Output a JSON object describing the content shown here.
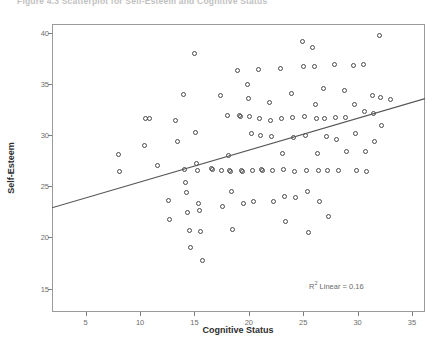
{
  "figure": {
    "caption": "Figure 4.3   Scatterplot for Self-Esteem and Cognitive Status"
  },
  "annotation": {
    "r2_prefix": "R",
    "r2_sup": "2",
    "r2_text": " Linear = 0.16"
  },
  "chart_data": {
    "type": "scatter",
    "title": "Figure 4.3   Scatterplot for Self-Esteem and Cognitive Status",
    "xlabel": "Cognitive Status",
    "ylabel": "Self-Esteem",
    "xlim": [
      1.9,
      36.2
    ],
    "ylim": [
      12.7,
      40.9
    ],
    "xticks": [
      5,
      10,
      15,
      20,
      25,
      30,
      35
    ],
    "yticks": [
      15,
      20,
      25,
      30,
      35,
      40
    ],
    "grid": false,
    "legend": null,
    "marker": "open-circle",
    "marker_color": "#4a4a4a",
    "annotations": [
      {
        "text": "R² Linear = 0.16",
        "x": 26.5,
        "y": 14.8
      }
    ],
    "fit_line": {
      "type": "linear",
      "r_squared": 0.16,
      "x_start": 1.9,
      "y_start": 22.9,
      "x_end": 36.2,
      "y_end": 33.6
    },
    "points": [
      [
        8.0,
        28.1
      ],
      [
        8.1,
        26.5
      ],
      [
        10.4,
        29.0
      ],
      [
        10.5,
        31.6
      ],
      [
        10.9,
        31.6
      ],
      [
        11.6,
        27.0
      ],
      [
        12.6,
        23.6
      ],
      [
        12.7,
        21.8
      ],
      [
        13.3,
        31.5
      ],
      [
        13.4,
        29.4
      ],
      [
        14.0,
        34.0
      ],
      [
        14.1,
        26.7
      ],
      [
        14.2,
        25.4
      ],
      [
        14.3,
        24.4
      ],
      [
        14.4,
        22.4
      ],
      [
        14.5,
        20.7
      ],
      [
        14.6,
        19.0
      ],
      [
        15.0,
        38.0
      ],
      [
        15.1,
        30.3
      ],
      [
        15.2,
        27.2
      ],
      [
        15.3,
        26.6
      ],
      [
        15.4,
        23.3
      ],
      [
        15.5,
        22.6
      ],
      [
        15.6,
        20.6
      ],
      [
        15.7,
        17.7
      ],
      [
        16.6,
        26.8
      ],
      [
        16.7,
        26.7
      ],
      [
        17.4,
        33.9
      ],
      [
        17.5,
        26.6
      ],
      [
        17.6,
        23.0
      ],
      [
        18.0,
        31.9
      ],
      [
        18.1,
        28.0
      ],
      [
        18.2,
        26.6
      ],
      [
        18.3,
        26.5
      ],
      [
        18.4,
        24.5
      ],
      [
        18.5,
        20.8
      ],
      [
        19.0,
        36.3
      ],
      [
        19.1,
        31.9
      ],
      [
        19.2,
        31.8
      ],
      [
        19.3,
        26.6
      ],
      [
        19.4,
        26.5
      ],
      [
        19.5,
        23.3
      ],
      [
        19.9,
        35.0
      ],
      [
        20.0,
        33.6
      ],
      [
        20.1,
        31.8
      ],
      [
        20.2,
        30.2
      ],
      [
        20.3,
        26.6
      ],
      [
        20.4,
        23.5
      ],
      [
        20.9,
        36.4
      ],
      [
        21.0,
        31.6
      ],
      [
        21.1,
        30.0
      ],
      [
        21.2,
        26.7
      ],
      [
        21.3,
        26.6
      ],
      [
        21.9,
        33.2
      ],
      [
        22.0,
        31.5
      ],
      [
        22.1,
        29.9
      ],
      [
        22.2,
        26.6
      ],
      [
        22.3,
        23.5
      ],
      [
        22.9,
        36.5
      ],
      [
        23.0,
        31.6
      ],
      [
        23.1,
        28.2
      ],
      [
        23.2,
        26.7
      ],
      [
        23.3,
        24.0
      ],
      [
        23.4,
        21.6
      ],
      [
        23.9,
        34.1
      ],
      [
        24.0,
        31.7
      ],
      [
        24.1,
        29.8
      ],
      [
        24.2,
        26.5
      ],
      [
        24.3,
        23.9
      ],
      [
        24.9,
        39.2
      ],
      [
        25.0,
        36.7
      ],
      [
        25.1,
        31.8
      ],
      [
        25.2,
        30.0
      ],
      [
        25.3,
        26.6
      ],
      [
        25.4,
        24.5
      ],
      [
        25.5,
        20.5
      ],
      [
        25.9,
        38.6
      ],
      [
        26.0,
        36.7
      ],
      [
        26.1,
        33.0
      ],
      [
        26.2,
        31.6
      ],
      [
        26.3,
        28.2
      ],
      [
        26.4,
        26.6
      ],
      [
        26.5,
        23.5
      ],
      [
        26.9,
        34.6
      ],
      [
        27.0,
        31.6
      ],
      [
        27.1,
        29.9
      ],
      [
        27.2,
        26.6
      ],
      [
        27.3,
        22.1
      ],
      [
        27.9,
        36.9
      ],
      [
        28.0,
        31.7
      ],
      [
        28.1,
        29.6
      ],
      [
        28.2,
        26.6
      ],
      [
        28.8,
        34.4
      ],
      [
        28.9,
        31.7
      ],
      [
        29.0,
        28.4
      ],
      [
        29.6,
        36.8
      ],
      [
        29.7,
        33.0
      ],
      [
        29.8,
        30.2
      ],
      [
        29.9,
        26.6
      ],
      [
        30.5,
        36.9
      ],
      [
        30.6,
        32.3
      ],
      [
        30.7,
        28.4
      ],
      [
        30.8,
        26.5
      ],
      [
        31.4,
        33.9
      ],
      [
        31.5,
        32.1
      ],
      [
        31.6,
        29.4
      ],
      [
        32.0,
        39.8
      ],
      [
        32.1,
        33.7
      ],
      [
        32.2,
        31.0
      ],
      [
        33.0,
        33.5
      ]
    ]
  }
}
